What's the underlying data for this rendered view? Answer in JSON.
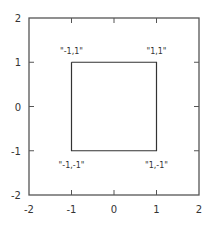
{
  "chart_data": {
    "type": "line",
    "title": "",
    "xlabel": "",
    "ylabel": "",
    "xlim": [
      -2,
      2
    ],
    "ylim": [
      -2,
      2
    ],
    "grid": false,
    "legend": null,
    "x_ticks": [
      -2,
      -1,
      0,
      1,
      2
    ],
    "y_ticks": [
      -2,
      -1,
      0,
      1,
      2
    ],
    "series": [
      {
        "name": "square",
        "points": [
          [
            -1,
            1
          ],
          [
            1,
            1
          ],
          [
            1,
            -1
          ],
          [
            -1,
            -1
          ],
          [
            -1,
            1
          ]
        ],
        "color": "#333333"
      }
    ],
    "annotations": [
      {
        "text": "\"-1,1\"",
        "x": -1,
        "y": 1,
        "position": "above"
      },
      {
        "text": "\"1,1\"",
        "x": 1,
        "y": 1,
        "position": "above"
      },
      {
        "text": "\"-1,-1\"",
        "x": -1,
        "y": -1,
        "position": "below"
      },
      {
        "text": "\"1,-1\"",
        "x": 1,
        "y": -1,
        "position": "below"
      }
    ]
  },
  "style": {
    "frame_color": "#555555",
    "line_color": "#333333",
    "text_color": "#333333"
  }
}
